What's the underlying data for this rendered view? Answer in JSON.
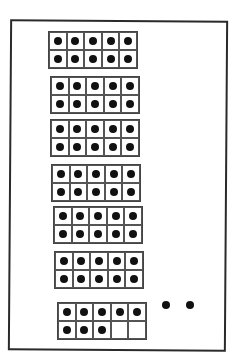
{
  "diagram": {
    "frames": [
      {
        "x": 48,
        "y": 31,
        "filled": 10
      },
      {
        "x": 50,
        "y": 76,
        "filled": 10
      },
      {
        "x": 50,
        "y": 119,
        "filled": 10
      },
      {
        "x": 51,
        "y": 164,
        "filled": 10
      },
      {
        "x": 53,
        "y": 206,
        "filled": 10
      },
      {
        "x": 54,
        "y": 251,
        "filled": 10
      },
      {
        "x": 57,
        "y": 302,
        "filled": 8
      }
    ],
    "loose_dots": [
      {
        "x": 162,
        "y": 301
      },
      {
        "x": 186,
        "y": 301
      }
    ],
    "total_counters": 70,
    "colors": {
      "border": "#2a2a2a",
      "dot": "#111111",
      "background": "#ffffff"
    }
  }
}
